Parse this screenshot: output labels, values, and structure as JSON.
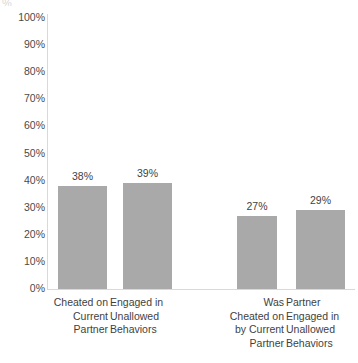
{
  "chart_data": {
    "type": "bar",
    "title": "",
    "xlabel": "",
    "ylabel": "",
    "ylim": [
      0,
      100
    ],
    "grid": false,
    "legend": "none",
    "y_ticks": [
      "100%",
      "90%",
      "80%",
      "70%",
      "60%",
      "50%",
      "40%",
      "30%",
      "20%",
      "10%",
      "0%"
    ],
    "categories": [
      "Cheated on\nCurrent\nPartner",
      "Engaged in\nUnallowed\nBehaviors",
      "Was\nCheated on\nby Current\nPartner",
      "Partner\nEngaged in\nUnallowed\nBehaviors"
    ],
    "values": [
      38,
      39,
      27,
      29
    ],
    "value_labels": [
      "38%",
      "39%",
      "27%",
      "29%"
    ],
    "bar_color": "#a9a9a9",
    "axis_color": "#d9d9d9",
    "text_color": "#3f3f3f",
    "background": "#ffffff"
  },
  "artifact": {
    "clipped_title": "%"
  }
}
